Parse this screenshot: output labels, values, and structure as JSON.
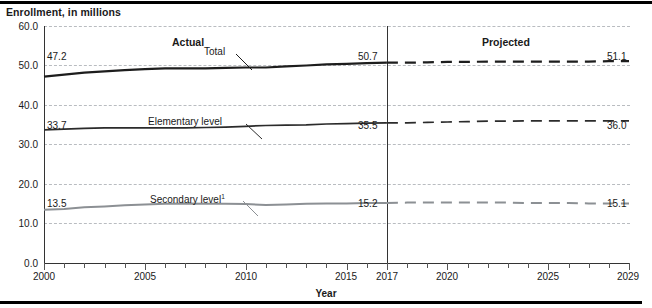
{
  "chart_data": {
    "type": "line",
    "title": "Enrollment, in millions",
    "xlabel": "Year",
    "ylabel": "",
    "xlim": [
      2000,
      2029
    ],
    "ylim": [
      0.0,
      60.0
    ],
    "ytick_labels": [
      "60.0",
      "50.0",
      "40.0",
      "30.0",
      "20.0",
      "10.0",
      "0.0"
    ],
    "yticks": [
      60.0,
      50.0,
      40.0,
      30.0,
      20.0,
      10.0,
      0.0
    ],
    "xtick_labels": [
      "2000",
      "2005",
      "2010",
      "2015",
      "2017",
      "2020",
      "2025",
      "2029"
    ],
    "xticks": [
      2000,
      2005,
      2010,
      2015,
      2017,
      2020,
      2025,
      2029
    ],
    "grid": "horizontal dashed gray",
    "legend_position": "inline-labels-with-leader-lines",
    "annotations": [
      {
        "name": "actual-period-label",
        "text": "Actual",
        "x": 2008.5,
        "y": 57.0
      },
      {
        "name": "projected-period-label",
        "text": "Projected",
        "x": 2023.0,
        "y": 57.0
      },
      {
        "name": "forecast-divider",
        "text": "2017",
        "x": 2017
      }
    ],
    "series": [
      {
        "name": "Total",
        "label": "Total",
        "color": "#1d1d1d",
        "width": 2.2,
        "actual_years": [
          2000,
          2001,
          2002,
          2003,
          2004,
          2005,
          2006,
          2007,
          2008,
          2009,
          2010,
          2011,
          2012,
          2013,
          2014,
          2015,
          2016,
          2017
        ],
        "actual_values": [
          47.2,
          47.7,
          48.2,
          48.5,
          48.8,
          49.1,
          49.3,
          49.3,
          49.3,
          49.4,
          49.5,
          49.5,
          49.8,
          50.0,
          50.3,
          50.4,
          50.6,
          50.7
        ],
        "projected_years": [
          2017,
          2018,
          2019,
          2020,
          2021,
          2022,
          2023,
          2024,
          2025,
          2026,
          2027,
          2028,
          2029
        ],
        "projected_values": [
          50.7,
          50.7,
          50.8,
          50.9,
          50.9,
          51.0,
          51.0,
          51.0,
          51.0,
          51.0,
          51.0,
          51.1,
          51.1
        ],
        "start_label": "47.2",
        "divider_label": "50.7",
        "end_label": "51.1"
      },
      {
        "name": "Elementary level",
        "label": "Elementary level",
        "color": "#2b2b2b",
        "width": 1.7,
        "actual_years": [
          2000,
          2001,
          2002,
          2003,
          2004,
          2005,
          2006,
          2007,
          2008,
          2009,
          2010,
          2011,
          2012,
          2013,
          2014,
          2015,
          2016,
          2017
        ],
        "actual_values": [
          33.7,
          33.9,
          34.1,
          34.2,
          34.2,
          34.2,
          34.2,
          34.2,
          34.3,
          34.4,
          34.6,
          34.8,
          34.9,
          35.0,
          35.2,
          35.3,
          35.4,
          35.5
        ],
        "projected_years": [
          2017,
          2018,
          2019,
          2020,
          2021,
          2022,
          2023,
          2024,
          2025,
          2026,
          2027,
          2028,
          2029
        ],
        "projected_values": [
          35.5,
          35.5,
          35.6,
          35.7,
          35.8,
          35.9,
          35.9,
          36.0,
          36.0,
          36.0,
          36.0,
          36.0,
          36.0
        ],
        "start_label": "33.7",
        "divider_label": "35.5",
        "end_label": "36.0"
      },
      {
        "name": "Secondary level",
        "label": "Secondary level",
        "label_footnote": "1",
        "color": "#8c9094",
        "width": 2.0,
        "actual_years": [
          2000,
          2001,
          2002,
          2003,
          2004,
          2005,
          2006,
          2007,
          2008,
          2009,
          2010,
          2011,
          2012,
          2013,
          2014,
          2015,
          2016,
          2017
        ],
        "actual_values": [
          13.5,
          13.7,
          14.1,
          14.3,
          14.6,
          14.8,
          15.0,
          15.1,
          15.0,
          15.0,
          14.9,
          14.7,
          14.8,
          15.0,
          15.1,
          15.1,
          15.2,
          15.2
        ],
        "projected_years": [
          2017,
          2018,
          2019,
          2020,
          2021,
          2022,
          2023,
          2024,
          2025,
          2026,
          2027,
          2028,
          2029
        ],
        "projected_values": [
          15.2,
          15.3,
          15.3,
          15.3,
          15.3,
          15.3,
          15.3,
          15.2,
          15.2,
          15.2,
          15.1,
          15.1,
          15.1
        ],
        "start_label": "13.5",
        "divider_label": "15.2",
        "end_label": "15.1"
      }
    ]
  },
  "title": {
    "text": "Enrollment, in millions"
  },
  "axis": {
    "x_title": "Year"
  },
  "labels": {
    "actual": "Actual",
    "projected": "Projected",
    "total": "Total",
    "elementary": "Elementary level",
    "secondary": "Secondary level",
    "secondary_footnote": "1"
  },
  "values": {
    "total_start": "47.2",
    "total_mid": "50.7",
    "total_end": "51.1",
    "elementary_start": "33.7",
    "elementary_mid": "35.5",
    "elementary_end": "36.0",
    "secondary_start": "13.5",
    "secondary_mid": "15.2",
    "secondary_end": "15.1"
  },
  "yticks": {
    "t60": "60.0",
    "t50": "50.0",
    "t40": "40.0",
    "t30": "30.0",
    "t20": "20.0",
    "t10": "10.0",
    "t0": "0.0"
  },
  "xticks": {
    "x2000": "2000",
    "x2005": "2005",
    "x2010": "2010",
    "x2015": "2015",
    "x2017": "2017",
    "x2020": "2020",
    "x2025": "2025",
    "x2029": "2029"
  },
  "colors": {
    "total": "#1d1d1d",
    "elementary": "#2b2b2b",
    "secondary": "#8c9094",
    "grid": "#b9bcc0",
    "axis": "#333333"
  }
}
